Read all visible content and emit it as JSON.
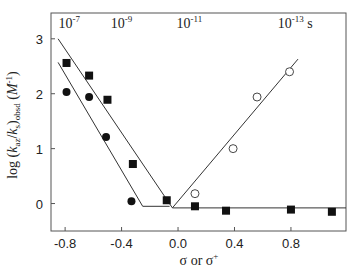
{
  "chart_data": {
    "type": "scatter",
    "title": "",
    "xlabel": "σ or σ+",
    "ylabel": "log (k_az/k_s)_obsd (M^-1)",
    "xlim": [
      -0.9,
      1.19
    ],
    "ylim": [
      -0.5,
      3.47
    ],
    "x_ticks": [
      -0.8,
      -0.4,
      0.0,
      0.4,
      0.8
    ],
    "x_tick_labels": [
      "-0.8",
      "-0.4",
      "0.0",
      "0.4",
      "0.8"
    ],
    "y_ticks": [
      0,
      1,
      2,
      3
    ],
    "y_tick_labels": [
      "0",
      "1",
      "2",
      "3"
    ],
    "grid": false,
    "legend": null,
    "top_annotations": [
      {
        "base": "10",
        "exp": "-7",
        "suffix": "",
        "x": -0.77
      },
      {
        "base": "10",
        "exp": "-9",
        "suffix": "",
        "x": -0.4
      },
      {
        "base": "10",
        "exp": "-11",
        "suffix": "",
        "x": 0.08
      },
      {
        "base": "10",
        "exp": "-13",
        "suffix": " s",
        "x": 0.83
      }
    ],
    "series": [
      {
        "name": "filled squares",
        "marker": "square-filled",
        "points": [
          [
            -0.79,
            2.56
          ],
          [
            -0.63,
            2.33
          ],
          [
            -0.5,
            1.89
          ],
          [
            -0.32,
            0.72
          ],
          [
            -0.08,
            0.06
          ],
          [
            0.12,
            -0.05
          ],
          [
            0.34,
            -0.13
          ],
          [
            0.8,
            -0.11
          ],
          [
            1.09,
            -0.15
          ]
        ]
      },
      {
        "name": "filled circles",
        "marker": "circle-filled",
        "points": [
          [
            -0.79,
            2.03
          ],
          [
            -0.63,
            1.94
          ],
          [
            -0.51,
            1.21
          ],
          [
            -0.33,
            0.04
          ]
        ]
      },
      {
        "name": "open circles",
        "marker": "circle-open",
        "points": [
          [
            0.12,
            0.18
          ],
          [
            0.39,
            1.0
          ],
          [
            0.56,
            1.94
          ],
          [
            0.79,
            2.4
          ]
        ]
      }
    ],
    "fit_lines": [
      {
        "name": "squares descending + plateau",
        "points": [
          [
            -0.85,
            3.0
          ],
          [
            -0.04,
            -0.08
          ],
          [
            1.19,
            -0.08
          ]
        ]
      },
      {
        "name": "circles descending + plateau",
        "points": [
          [
            -0.85,
            2.57
          ],
          [
            -0.25,
            -0.05
          ],
          [
            -0.06,
            -0.05
          ]
        ]
      },
      {
        "name": "open circles ascending",
        "points": [
          [
            -0.04,
            -0.08
          ],
          [
            0.85,
            2.63
          ]
        ]
      }
    ]
  }
}
